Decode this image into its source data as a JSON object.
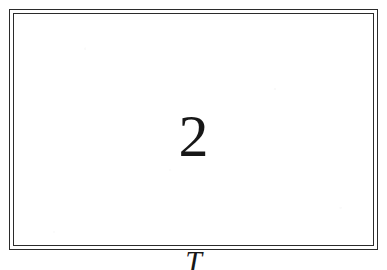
{
  "document": {
    "kind": "scanned-figure",
    "page_background": "#ffffff",
    "ink_color": "#171717",
    "rule_color": "#2b2b2b"
  },
  "figure": {
    "frame": {
      "style": "double-rule-rectangle",
      "line_count": 2
    },
    "content": {
      "number_label": "2"
    }
  },
  "caption": {
    "symbol": "T",
    "note": "cropped at page edge"
  }
}
